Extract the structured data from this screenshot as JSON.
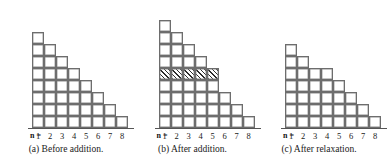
{
  "figure": {
    "axis_label": "n =",
    "tick_labels": [
      "1",
      "2",
      "3",
      "4",
      "5",
      "6",
      "7",
      "8"
    ],
    "colors": {
      "cell_border": "#6d6d6d",
      "cell_fill": "#ffffff",
      "hatch_line": "#2e2e2e",
      "axis": "#555555",
      "text": "#1a1a1a",
      "background": "#ffffff"
    },
    "geometry": {
      "cell_size_px": 12,
      "columns": 8
    }
  },
  "chart_data": [
    {
      "type": "bar",
      "panel": "a",
      "title": "(a) Before addition.",
      "xlabel": "n =",
      "ylabel": "",
      "categories": [
        "1",
        "2",
        "3",
        "4",
        "5",
        "6",
        "7",
        "8"
      ],
      "values": [
        8,
        7,
        6,
        5,
        4,
        3,
        2,
        1
      ],
      "ylim": [
        0,
        9
      ],
      "grid": false,
      "legend": null,
      "unit_cells": true,
      "hatched_row_index": null,
      "hatched_row_span": 0,
      "notes": "Unit-square staircase histogram; column n has 9-n cells."
    },
    {
      "type": "bar",
      "panel": "b",
      "title": "(b) After addition.",
      "xlabel": "n =",
      "ylabel": "",
      "categories": [
        "1",
        "2",
        "3",
        "4",
        "5",
        "6",
        "7",
        "8"
      ],
      "values": [
        9,
        8,
        7,
        6,
        5,
        3,
        2,
        1
      ],
      "ylim": [
        0,
        9
      ],
      "grid": false,
      "legend": null,
      "unit_cells": true,
      "hatched_row_index": 4,
      "hatched_row_span": 5,
      "notes": "A hatched unit row is inserted at level 5 across columns 1-5, lifting the cells above it by one."
    },
    {
      "type": "bar",
      "panel": "c",
      "title": "(c) After relaxation.",
      "xlabel": "n =",
      "ylabel": "",
      "categories": [
        "1",
        "2",
        "3",
        "4",
        "5",
        "6",
        "7",
        "8"
      ],
      "values": [
        7,
        6,
        5,
        5,
        4,
        3,
        2,
        1
      ],
      "ylim": [
        0,
        9
      ],
      "grid": false,
      "legend": null,
      "unit_cells": true,
      "hatched_row_index": null,
      "hatched_row_span": 0,
      "notes": "Relaxed staircase; total height reduced to 7 with a flat step at columns 3-4."
    }
  ],
  "captions": {
    "a": "(a) Before addition.",
    "b": "(b) After addition.",
    "c": "(c) After relaxation."
  }
}
